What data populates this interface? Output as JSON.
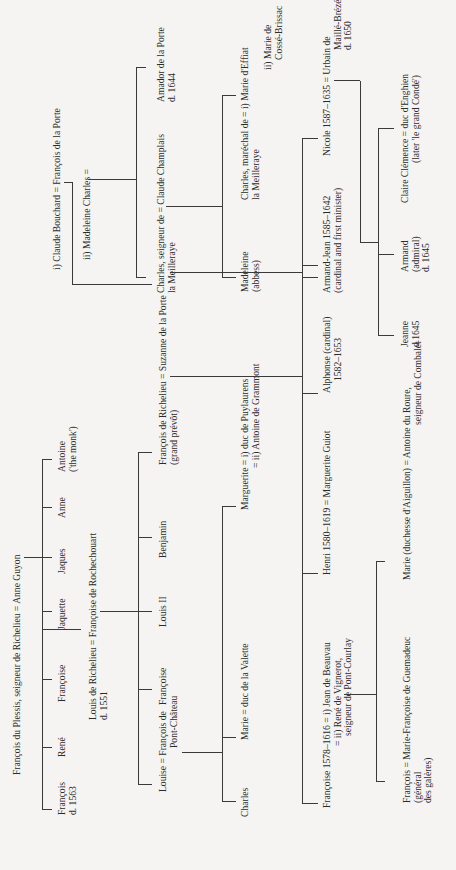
{
  "chart": {
    "generation_1": {
      "couple": "François du Plessis, seigneur de Richelieu = Anne Guyon",
      "children": [
        {
          "name": "François",
          "note": "d. 1563"
        },
        {
          "name": "René"
        },
        {
          "name": "Françoise"
        },
        {
          "name": "Jaquette"
        },
        {
          "name": "Jaques"
        },
        {
          "name": "Anne"
        },
        {
          "name": "Antoine",
          "note": "('the monk')"
        }
      ]
    },
    "louis": {
      "line1": "Louis de Richelieu = Françoise de Rochechouart",
      "line2": "d. 1551"
    },
    "generation_2": {
      "children": [
        {
          "name": "Louise = François de",
          "note": "Pont-Château"
        },
        {
          "name": "Françoise"
        },
        {
          "name": "Louis II"
        },
        {
          "name": "Benjamin"
        },
        {
          "name": "François de Richelieu = Suzanne de la Porte",
          "note": "(grand prévôt)"
        }
      ]
    },
    "pont_chateau_children": [
      {
        "name": "Charles"
      },
      {
        "name": "Marie = duc de la Valette"
      },
      {
        "name": "Marguerite = i) duc de Puylaurens",
        "note": "= ii) Antoine de Grammont"
      }
    ],
    "la_porte": {
      "couple_1": "i) Claude Bouchard = François de la Porte",
      "couple_2": "ii) Madeleine Charles =",
      "children": [
        {
          "name": "Charles, seigneur de = Claude Champlais",
          "note": "la Meilleraye"
        },
        {
          "name": "Amador de la Porte",
          "note": "d. 1644"
        }
      ],
      "grandchildren": [
        {
          "name": "Madeleine",
          "note": "(abbess)"
        },
        {
          "name": "Charles, maréchal de = i) Marie d'Effiat",
          "note": "la Meilleraye"
        }
      ],
      "second_wife": {
        "line1": "ii) Marie de",
        "line2": "Cossé-Brissac"
      }
    },
    "generation_3": {
      "children": [
        {
          "name": "Françoise 1578–1616 = i) Jean de Beauvau",
          "note1": "= ii) René de Vignerot,",
          "note2": "seigneur de Pont-Courlay"
        },
        {
          "name": "Henri 1580–1619 = Marguerite Guiot"
        },
        {
          "name": "Alphonse (cardinal)",
          "note": "1582–1653"
        },
        {
          "name": "Armand-Jean 1585–1642",
          "note": "(cardinal and first minister)"
        },
        {
          "name": "Nicole 1587–1635 = Urbain de",
          "note1": "Maillé-Brézé",
          "note2": "d. 1650"
        }
      ]
    },
    "vignerot_children": [
      {
        "name": "François  = Marie-Françoise de Guemadeuc",
        "note1": "(général",
        "note2": "des galères)"
      },
      {
        "name": "Marie (duchesse d'Aiguillon) = Antoine du Roure,",
        "note": "seigneur de Combalet"
      }
    ],
    "maille_children": [
      {
        "name": "Jeanne",
        "note": "d.1645"
      },
      {
        "name": "Armand",
        "note1": "(admiral)",
        "note2": "d. 1645"
      },
      {
        "name": "Claire Clémence = duc d'Enghien",
        "note": "(later 'le grand Condé')"
      }
    ]
  }
}
